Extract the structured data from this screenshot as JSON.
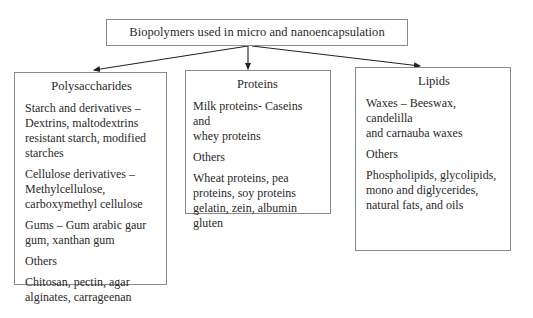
{
  "diagram": {
    "title": "Biopolymers used in micro and nanoencapsulation",
    "categories": [
      {
        "title": "Polysaccharides",
        "items": [
          "Starch and derivatives –\nDextrins, maltodextrins\nresistant starch, modified\nstarches",
          "Cellulose derivatives –\nMethylcellulose,\ncarboxymethyl cellulose",
          "Gums – Gum arabic gaur\ngum, xanthan gum",
          "Others",
          "Chitosan, pectin, agar\nalginates, carrageenan"
        ]
      },
      {
        "title": "Proteins",
        "items": [
          "Milk proteins- Caseins and\nwhey proteins",
          "Others",
          "Wheat proteins, pea\nproteins, soy proteins\ngelatin, zein, albumin\ngluten"
        ]
      },
      {
        "title": "Lipids",
        "items": [
          "Waxes – Beeswax, candelilla\nand carnauba waxes",
          "Others",
          "Phospholipids, glycolipids,\nmono and diglycerides,\nnatural fats, and oils"
        ]
      }
    ],
    "colors": {
      "border": "#8a8a8a",
      "arrow": "#222222",
      "text": "#2a2a2a"
    }
  }
}
